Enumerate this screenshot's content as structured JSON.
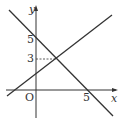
{
  "diagram": {
    "axes": {
      "x_label": "x",
      "y_label": "y",
      "origin_label": "O",
      "x_ticks": [
        {
          "value": 5,
          "label": "5"
        }
      ],
      "y_ticks": [
        {
          "value": 5,
          "label": "5"
        },
        {
          "value": 3,
          "label": "3"
        }
      ]
    },
    "lines": [
      {
        "name": "decreasing-line",
        "equation": "y = -x + 5",
        "points": [
          [
            0,
            5
          ],
          [
            5,
            0
          ]
        ]
      },
      {
        "name": "increasing-line",
        "equation": "y = x + 1",
        "points": [
          [
            0,
            1
          ],
          [
            2,
            3
          ]
        ]
      }
    ],
    "intersection": {
      "x": 2,
      "y": 3,
      "guide": "dashed horizontal to y-axis"
    },
    "colors": {
      "line": "#333333",
      "background": "#ffffff"
    }
  }
}
